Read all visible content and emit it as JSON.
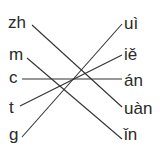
{
  "left": [
    {
      "text": "zh",
      "x": 8,
      "y": 13
    },
    {
      "text": "m",
      "x": 9,
      "y": 48
    },
    {
      "text": "c",
      "x": 9,
      "y": 81
    },
    {
      "text": "t",
      "x": 9,
      "y": 113
    },
    {
      "text": "g",
      "x": 9,
      "y": 145
    }
  ],
  "right": [
    {
      "text": "uì",
      "x": 124,
      "y": 13
    },
    {
      "text": "iě",
      "x": 124,
      "y": 48
    },
    {
      "text": "án",
      "x": 124,
      "y": 81
    },
    {
      "text": "uàn",
      "x": 124,
      "y": 113
    },
    {
      "text": "ǐn",
      "x": 124,
      "y": 145
    }
  ],
  "connections": [
    {
      "from": "zh",
      "to": "uàn"
    },
    {
      "from": "m",
      "to": "ǐn"
    },
    {
      "from": "c",
      "to": "án"
    },
    {
      "from": "t",
      "to": "iě"
    },
    {
      "from": "g",
      "to": "uì"
    }
  ]
}
